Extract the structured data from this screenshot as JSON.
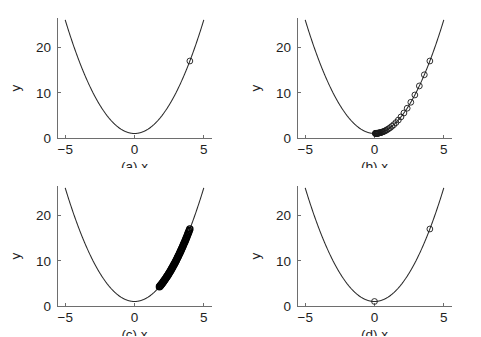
{
  "figure": {
    "background": "#ffffff",
    "curve_color": "#2b2b2b",
    "marker_color": "#1a1a1a",
    "axis_color": "#6e6e6e",
    "rows": 2,
    "cols": 2
  },
  "chart_data": [
    {
      "type": "line",
      "panel": "a",
      "caption": "(a)  x",
      "panel_letter": "(a)",
      "title": "",
      "xlabel": "x",
      "ylabel": "y",
      "xlim": [
        -5.6,
        5.6
      ],
      "ylim": [
        0,
        26.5
      ],
      "xticks": [
        -5,
        0,
        5
      ],
      "xticklabels": [
        "−5",
        "0",
        "5"
      ],
      "yticks": [
        0,
        10,
        20
      ],
      "yticklabels": [
        "0",
        "10",
        "20"
      ],
      "grid": false,
      "legend": "none",
      "function": "y = x^2 + 1",
      "curve_x_range": [
        -5.0,
        5.0
      ],
      "markers": {
        "style": "open-circle",
        "count": 1,
        "x": [
          4.0
        ],
        "y": [
          17.0
        ]
      }
    },
    {
      "type": "line",
      "panel": "b",
      "caption": "(b)  x",
      "panel_letter": "(b)",
      "title": "",
      "xlabel": "x",
      "ylabel": "y",
      "xlim": [
        -5.6,
        5.6
      ],
      "ylim": [
        0,
        26.5
      ],
      "xticks": [
        -5,
        0,
        5
      ],
      "xticklabels": [
        "−5",
        "0",
        "5"
      ],
      "yticks": [
        0,
        10,
        20
      ],
      "yticklabels": [
        "0",
        "10",
        "20"
      ],
      "grid": false,
      "legend": "none",
      "function": "y = x^2 + 1",
      "curve_x_range": [
        -5.0,
        5.0
      ],
      "markers": {
        "style": "open-circle",
        "count": 40,
        "x": [
          4.0,
          3.6,
          3.24,
          2.916,
          2.624,
          2.362,
          2.126,
          1.913,
          1.722,
          1.55,
          1.395,
          1.255,
          1.13,
          1.017,
          0.915,
          0.824,
          0.741,
          0.667,
          0.601,
          0.54,
          0.486,
          0.438,
          0.394,
          0.355,
          0.319,
          0.287,
          0.258,
          0.233,
          0.209,
          0.188,
          0.169,
          0.152,
          0.137,
          0.124,
          0.111,
          0.1,
          0.09,
          0.081,
          0.073,
          0.066
        ],
        "y": [
          17.0,
          13.96,
          11.498,
          9.503,
          7.888,
          6.579,
          5.52,
          4.66,
          3.965,
          3.403,
          2.946,
          2.575,
          2.277,
          2.034,
          1.837,
          1.679,
          1.549,
          1.445,
          1.361,
          1.292,
          1.236,
          1.192,
          1.155,
          1.126,
          1.102,
          1.082,
          1.067,
          1.054,
          1.044,
          1.035,
          1.029,
          1.023,
          1.019,
          1.015,
          1.012,
          1.01,
          1.008,
          1.007,
          1.005,
          1.004
        ]
      }
    },
    {
      "type": "line",
      "panel": "c",
      "caption": "(c)  x",
      "panel_letter": "(c)",
      "title": "",
      "xlabel": "x",
      "ylabel": "y",
      "xlim": [
        -5.6,
        5.6
      ],
      "ylim": [
        0,
        26.5
      ],
      "xticks": [
        -5,
        0,
        5
      ],
      "xticklabels": [
        "−5",
        "0",
        "5"
      ],
      "yticks": [
        0,
        10,
        20
      ],
      "yticklabels": [
        "0",
        "10",
        "20"
      ],
      "grid": false,
      "legend": "none",
      "function": "y = x^2 + 1",
      "curve_x_range": [
        -5.0,
        5.0
      ],
      "markers": {
        "style": "open-circle-dense",
        "count": 60,
        "x_start": 4.0,
        "x_end": 1.8,
        "y_start": 17.0,
        "y_end": 4.24,
        "note": "dense overlapping cluster along right branch, stalled above minimum"
      }
    },
    {
      "type": "line",
      "panel": "d",
      "caption": "(d)  x",
      "panel_letter": "(d)",
      "title": "",
      "xlabel": "x",
      "ylabel": "y",
      "xlim": [
        -5.6,
        5.6
      ],
      "ylim": [
        0,
        26.5
      ],
      "xticks": [
        -5,
        0,
        5
      ],
      "xticklabels": [
        "−5",
        "0",
        "5"
      ],
      "yticks": [
        0,
        10,
        20
      ],
      "yticklabels": [
        "0",
        "10",
        "20"
      ],
      "grid": false,
      "legend": "none",
      "function": "y = x^2 + 1",
      "curve_x_range": [
        -5.0,
        5.0
      ],
      "markers": {
        "style": "open-circle",
        "count": 2,
        "x": [
          4.0,
          0.0
        ],
        "y": [
          17.0,
          1.0
        ]
      }
    }
  ]
}
